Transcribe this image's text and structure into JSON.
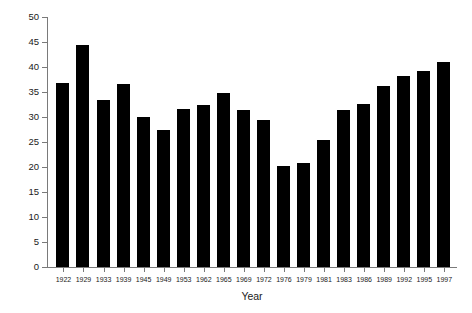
{
  "chart_data": {
    "type": "bar",
    "title": "",
    "subtitle": "",
    "xlabel": "Year",
    "ylabel": "Percentage",
    "categories": [
      "1922",
      "1929",
      "1933",
      "1939",
      "1945",
      "1949",
      "1953",
      "1962",
      "1965",
      "1969",
      "1972",
      "1976",
      "1979",
      "1981",
      "1983",
      "1986",
      "1989",
      "1992",
      "1995",
      "1997"
    ],
    "values": [
      36.8,
      44.4,
      33.4,
      36.6,
      30.0,
      27.4,
      31.6,
      32.4,
      34.8,
      31.4,
      29.4,
      20.2,
      20.8,
      25.4,
      31.4,
      32.6,
      36.2,
      38.2,
      39.2,
      41.0
    ],
    "series": [
      {
        "name": "Percentage",
        "values": [
          36.8,
          44.4,
          33.4,
          36.6,
          30.0,
          27.4,
          31.6,
          32.4,
          34.8,
          31.4,
          29.4,
          20.2,
          20.8,
          25.4,
          31.4,
          32.6,
          36.2,
          38.2,
          39.2,
          41.0
        ]
      }
    ],
    "ylim": [
      0,
      50
    ],
    "yticks": [
      0,
      5,
      10,
      15,
      20,
      25,
      30,
      35,
      40,
      45,
      50
    ],
    "ytick_labels": [
      "0",
      "5",
      "10",
      "15",
      "20",
      "25",
      "30",
      "35",
      "40",
      "45",
      "50"
    ],
    "grid": false,
    "legend": false,
    "legend_position": "none",
    "bar_color": "#000000",
    "axis_color": "#7a7a7a",
    "background_color": "#ffffff"
  }
}
